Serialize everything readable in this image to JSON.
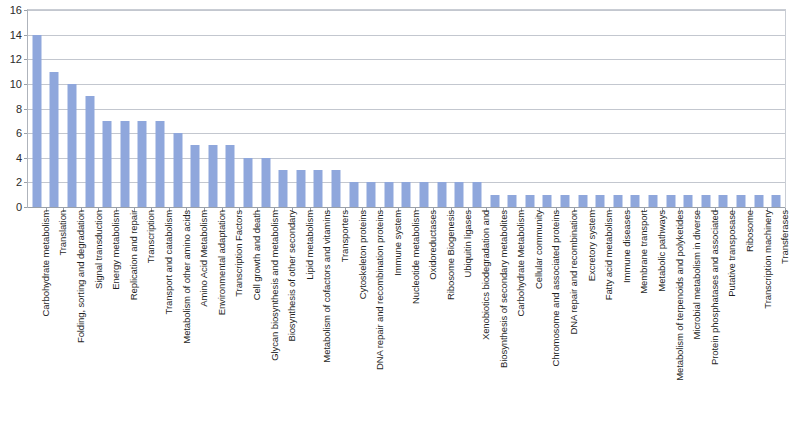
{
  "chart_data": {
    "type": "bar",
    "title": "",
    "subtitle": "",
    "xlabel": "",
    "ylabel": "",
    "ylim": [
      0,
      16
    ],
    "y_ticks": [
      0,
      2,
      4,
      6,
      8,
      10,
      12,
      14,
      16
    ],
    "grid": true,
    "legend": false,
    "legend_position": "none",
    "bar_color": "#8fa7dc",
    "categories": [
      "Carbohydrate metabolism",
      "Translation",
      "Folding, sorting and degradation",
      "Signal transduction",
      "Energy metabolism",
      "Replication and repair",
      "Transcription",
      "Transport and catabolism",
      "Metabolism of other amino acids",
      "Amino Acid Metabolism",
      "Environmental adaptation",
      "Transcription Factors",
      "Cell growth and death",
      "Glycan biosynthesis and metabolism",
      "Biosynthesis of other secondary",
      "Lipid metabolism",
      "Metabolism of cofactors and vitamins",
      "Transporters",
      "Cytoskeleton proteins",
      "DNA repair and recombination proteins",
      "Immune system",
      "Nucleotide metabolism",
      "Oxidoreductases",
      "Ribosome Biogenesis",
      "Ubiquitin ligases",
      "Xenobiotics biodegradation and",
      "Biosynthesis of secondary metabolites",
      "Carbohydrate Metabolism",
      "Cellular community",
      "Chromosome and associated proteins",
      "DNA repair and recombination",
      "Excretory system",
      "Fatty acid metabolism",
      "Immune diseases",
      "Membrane transport",
      "Metabolic pathways",
      "Metabolism of terpenoids and polyketides",
      "Microbial metabolism in diverse",
      "Protein phosphatases and associated",
      "Putative transposase",
      "Ribosome",
      "Transcription machinery",
      "Transferases"
    ],
    "values": [
      14,
      11,
      10,
      9,
      7,
      7,
      7,
      7,
      6,
      5,
      5,
      5,
      4,
      4,
      3,
      3,
      3,
      3,
      2,
      2,
      2,
      2,
      2,
      2,
      2,
      2,
      1,
      1,
      1,
      1,
      1,
      1,
      1,
      1,
      1,
      1,
      1,
      1,
      1,
      1,
      1,
      1,
      1
    ]
  }
}
